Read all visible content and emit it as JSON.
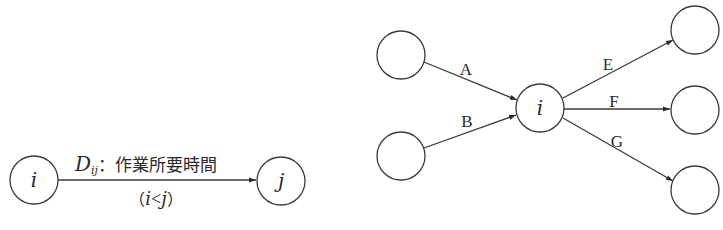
{
  "left_diagram": {
    "source_node": {
      "label": "i",
      "cx": 34,
      "cy": 180,
      "r": 24
    },
    "target_node": {
      "label": "j",
      "cx": 281,
      "cy": 181,
      "r": 24
    },
    "edge_label": {
      "symbol": "D",
      "subscript": "ij",
      "separator": "：",
      "description": "作業所要時間"
    },
    "condition": {
      "open": "（",
      "left": "i",
      "op": "<",
      "right": "j",
      "close": "）"
    }
  },
  "right_diagram": {
    "center_node": {
      "label": "i",
      "cx": 540,
      "cy": 108,
      "r": 24
    },
    "incoming": [
      {
        "label": "A",
        "from": {
          "cx": 401,
          "cy": 55,
          "r": 24
        }
      },
      {
        "label": "B",
        "from": {
          "cx": 401,
          "cy": 156,
          "r": 24
        }
      }
    ],
    "outgoing": [
      {
        "label": "E",
        "to": {
          "cx": 695,
          "cy": 30,
          "r": 24
        }
      },
      {
        "label": "F",
        "to": {
          "cx": 695,
          "cy": 110,
          "r": 24
        }
      },
      {
        "label": "G",
        "to": {
          "cx": 695,
          "cy": 190,
          "r": 24
        }
      }
    ]
  }
}
